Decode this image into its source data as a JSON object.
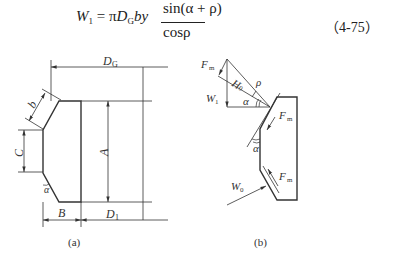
{
  "equation": {
    "lhs": "W",
    "lhs_sub": "1",
    "equals": "=",
    "pi": "π",
    "d": "D",
    "d_sub": "G",
    "by": "by",
    "numerator": "sin(α + ρ)",
    "denominator": "cosρ",
    "number": "（4-75）"
  },
  "figure_a": {
    "caption": "(a)",
    "labels": {
      "DG": "D",
      "DG_sub": "G",
      "b": "b",
      "C": "C",
      "A": "A",
      "alpha": "α",
      "B": "B",
      "D1": "D",
      "D1_sub": "1"
    }
  },
  "figure_b": {
    "caption": "(b)",
    "labels": {
      "Fm": "F",
      "Fm_sub": "m",
      "W0": "W",
      "W0_sub": "0",
      "W1": "W",
      "W1_sub": "1",
      "rho": "ρ",
      "alpha": "α"
    }
  }
}
